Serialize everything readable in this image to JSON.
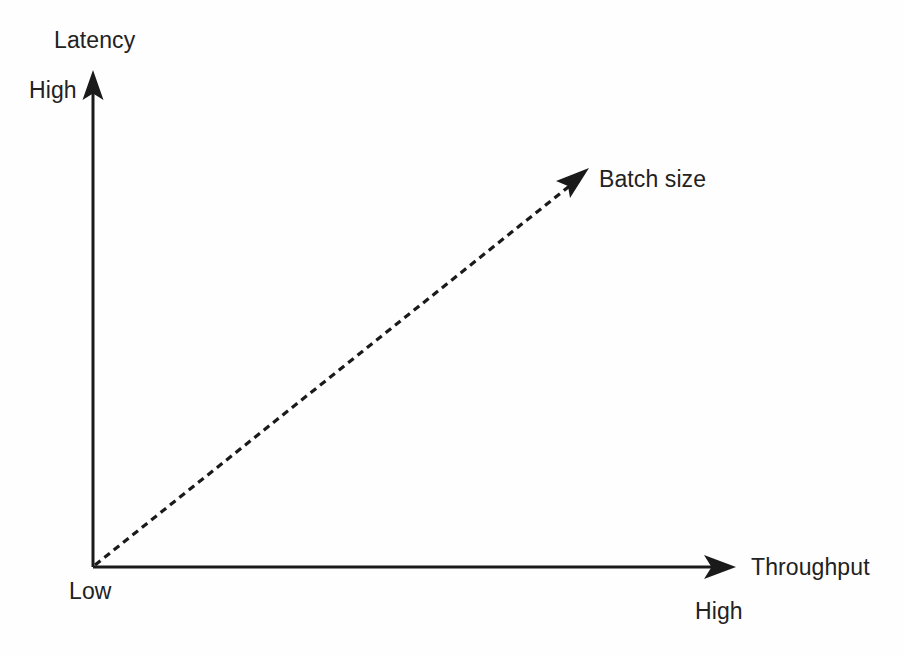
{
  "diagram": {
    "title_text": "Latency",
    "type": "tradeoff-quadrant-arrow-diagram",
    "background_color": "#fefefe",
    "stroke_color": "#1a1a1a",
    "y_axis": {
      "name": "Latency",
      "label": "Latency",
      "high_label": "High",
      "low_label": "Low",
      "direction": "up",
      "arrow_style": "solid"
    },
    "x_axis": {
      "name": "Throughput",
      "label": "Throughput",
      "high_label": "High",
      "low_label": "Low",
      "direction": "right",
      "arrow_style": "solid"
    },
    "trend_arrow": {
      "label": "Batch size",
      "style": "dashed",
      "direction": "up-right",
      "from": "origin",
      "to": "high-latency-high-throughput",
      "dash_pattern": "7 5"
    },
    "origin_label": "Low"
  }
}
